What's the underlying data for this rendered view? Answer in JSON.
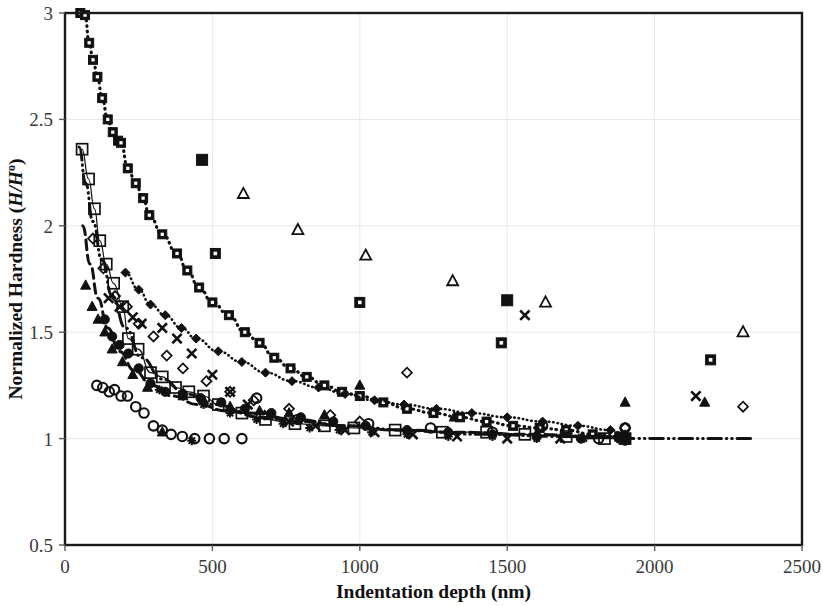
{
  "figure": {
    "background_color": "#ffffff",
    "ink_color": "#111111",
    "grid_color": "#e8e8e8"
  },
  "axes": {
    "x_title": "Indentation depth (nm)",
    "y_title_prefix": "Normalized Hardness (",
    "y_title_italic": "H/H",
    "y_title_sup": "o",
    "y_title_suffix": ")",
    "x_ticks": [
      "0",
      "500",
      "1000",
      "1500",
      "2000",
      "2500"
    ],
    "y_ticks": [
      "0.5",
      "1",
      "1.5",
      "2",
      "2.5",
      "3"
    ]
  },
  "chart_data": {
    "type": "scatter",
    "title": "",
    "xlabel": "Indentation depth (nm)",
    "ylabel": "Normalized Hardness (H/H°)",
    "xlim": [
      0,
      2500
    ],
    "ylim": [
      0.5,
      3
    ],
    "xticks": [
      0,
      500,
      1000,
      1500,
      2000,
      2500
    ],
    "yticks": [
      0.5,
      1,
      1.5,
      2,
      2.5,
      3
    ],
    "grid": "horizontal",
    "legend": "none",
    "series": [
      {
        "name": "dotted-square-dot",
        "marker": "square-dot",
        "line": "dotted",
        "line_width": 3.2,
        "marker_size": 9,
        "points": [
          [
            52,
            3.0
          ],
          [
            68,
            2.99
          ],
          [
            82,
            2.86
          ],
          [
            95,
            2.78
          ],
          [
            110,
            2.7
          ],
          [
            126,
            2.6
          ],
          [
            145,
            2.5
          ],
          [
            162,
            2.44
          ],
          [
            180,
            2.4
          ],
          [
            190,
            2.39
          ],
          [
            213,
            2.27
          ],
          [
            240,
            2.2
          ],
          [
            265,
            2.13
          ],
          [
            286,
            2.05
          ],
          [
            330,
            1.96
          ],
          [
            380,
            1.87
          ],
          [
            415,
            1.79
          ],
          [
            455,
            1.71
          ],
          [
            500,
            1.64
          ],
          [
            556,
            1.58
          ],
          [
            610,
            1.5
          ],
          [
            660,
            1.45
          ],
          [
            710,
            1.38
          ],
          [
            765,
            1.33
          ],
          [
            820,
            1.29
          ],
          [
            880,
            1.25
          ],
          [
            940,
            1.22
          ],
          [
            1000,
            1.2
          ],
          [
            1080,
            1.17
          ],
          [
            1160,
            1.14
          ],
          [
            1250,
            1.12
          ],
          [
            1340,
            1.1
          ],
          [
            1430,
            1.08
          ],
          [
            1520,
            1.06
          ],
          [
            1610,
            1.05
          ],
          [
            1700,
            1.04
          ],
          [
            1790,
            1.02
          ],
          [
            1880,
            1.01
          ],
          [
            1900,
            1.0
          ]
        ]
      },
      {
        "name": "open-square-thin-line",
        "marker": "square-open",
        "line": "solid-thin",
        "line_width": 1.2,
        "marker_size": 11,
        "points": [
          [
            58,
            2.36
          ],
          [
            80,
            2.22
          ],
          [
            100,
            2.08
          ],
          [
            118,
            1.93
          ],
          [
            140,
            1.82
          ],
          [
            165,
            1.73
          ],
          [
            196,
            1.62
          ],
          [
            215,
            1.47
          ],
          [
            248,
            1.42
          ],
          [
            290,
            1.31
          ],
          [
            330,
            1.29
          ],
          [
            375,
            1.24
          ],
          [
            420,
            1.22
          ],
          [
            470,
            1.2
          ],
          [
            520,
            1.16
          ],
          [
            600,
            1.12
          ],
          [
            680,
            1.09
          ],
          [
            780,
            1.07
          ],
          [
            880,
            1.06
          ],
          [
            980,
            1.05
          ],
          [
            1120,
            1.04
          ],
          [
            1280,
            1.03
          ],
          [
            1430,
            1.03
          ],
          [
            1560,
            1.02
          ],
          [
            1700,
            1.01
          ],
          [
            1830,
            1.0
          ],
          [
            1900,
            1.0
          ]
        ]
      },
      {
        "name": "open-diamond",
        "marker": "diamond-open",
        "line": "none",
        "marker_size": 10,
        "points": [
          [
            95,
            1.94
          ],
          [
            130,
            1.8
          ],
          [
            170,
            1.67
          ],
          [
            210,
            1.62
          ],
          [
            250,
            1.54
          ],
          [
            300,
            1.48
          ],
          [
            345,
            1.39
          ],
          [
            400,
            1.33
          ],
          [
            480,
            1.27
          ],
          [
            560,
            1.22
          ],
          [
            640,
            1.18
          ],
          [
            760,
            1.14
          ],
          [
            900,
            1.11
          ],
          [
            1000,
            1.08
          ],
          [
            1160,
            1.31
          ],
          [
            1900,
            1.05
          ],
          [
            2300,
            1.15
          ]
        ]
      },
      {
        "name": "filled-diamond-dotted",
        "marker": "diamond-filled",
        "line": "dotted",
        "line_width": 2.6,
        "marker_size": 9,
        "points": [
          [
            205,
            1.78
          ],
          [
            250,
            1.7
          ],
          [
            290,
            1.63
          ],
          [
            340,
            1.58
          ],
          [
            395,
            1.52
          ],
          [
            445,
            1.47
          ],
          [
            520,
            1.41
          ],
          [
            600,
            1.36
          ],
          [
            680,
            1.31
          ],
          [
            770,
            1.27
          ],
          [
            860,
            1.24
          ],
          [
            950,
            1.21
          ],
          [
            1050,
            1.18
          ],
          [
            1150,
            1.16
          ],
          [
            1260,
            1.14
          ],
          [
            1380,
            1.12
          ],
          [
            1500,
            1.1
          ],
          [
            1620,
            1.08
          ],
          [
            1740,
            1.06
          ],
          [
            1850,
            1.04
          ],
          [
            1900,
            1.02
          ]
        ]
      },
      {
        "name": "open-triangle",
        "marker": "triangle-open",
        "line": "none",
        "marker_size": 11,
        "points": [
          [
            605,
            2.15
          ],
          [
            790,
            1.98
          ],
          [
            1020,
            1.86
          ],
          [
            1315,
            1.74
          ],
          [
            1630,
            1.64
          ],
          [
            2300,
            1.5
          ]
        ]
      },
      {
        "name": "filled-square",
        "marker": "square-filled",
        "line": "none",
        "marker_size": 11,
        "points": [
          [
            465,
            2.31
          ],
          [
            1500,
            1.65
          ]
        ]
      },
      {
        "name": "square-dot-outlier",
        "marker": "square-dot",
        "line": "none",
        "marker_size": 10,
        "points": [
          [
            510,
            1.87
          ],
          [
            1000,
            1.64
          ],
          [
            1480,
            1.45
          ],
          [
            2190,
            1.37
          ]
        ]
      },
      {
        "name": "x-cross",
        "marker": "x",
        "line": "none",
        "marker_size": 11,
        "points": [
          [
            148,
            1.66
          ],
          [
            185,
            1.62
          ],
          [
            230,
            1.57
          ],
          [
            260,
            1.54
          ],
          [
            330,
            1.52
          ],
          [
            380,
            1.47
          ],
          [
            430,
            1.4
          ],
          [
            500,
            1.3
          ],
          [
            560,
            1.22
          ],
          [
            620,
            1.16
          ],
          [
            690,
            1.11
          ],
          [
            760,
            1.08
          ],
          [
            850,
            1.06
          ],
          [
            950,
            1.04
          ],
          [
            1050,
            1.03
          ],
          [
            1180,
            1.02
          ],
          [
            1330,
            1.01
          ],
          [
            1500,
            1.0
          ],
          [
            1680,
            1.0
          ],
          [
            1560,
            1.58
          ],
          [
            2140,
            1.2
          ]
        ]
      },
      {
        "name": "filled-triangle",
        "marker": "triangle-filled",
        "line": "none",
        "marker_size": 10,
        "points": [
          [
            70,
            1.72
          ],
          [
            92,
            1.62
          ],
          [
            112,
            1.56
          ],
          [
            135,
            1.5
          ],
          [
            160,
            1.42
          ],
          [
            195,
            1.36
          ],
          [
            230,
            1.3
          ],
          [
            280,
            1.24
          ],
          [
            330,
            1.03
          ],
          [
            400,
            1.2
          ],
          [
            470,
            1.18
          ],
          [
            560,
            1.15
          ],
          [
            660,
            1.13
          ],
          [
            760,
            1.12
          ],
          [
            880,
            1.11
          ],
          [
            1000,
            1.25
          ],
          [
            1320,
            1.1
          ],
          [
            1900,
            1.17
          ],
          [
            2170,
            1.17
          ]
        ]
      },
      {
        "name": "filled-circle",
        "marker": "circle-filled",
        "line": "none",
        "marker_size": 10,
        "points": [
          [
            135,
            1.56
          ],
          [
            160,
            1.48
          ],
          [
            185,
            1.44
          ],
          [
            215,
            1.4
          ],
          [
            250,
            1.33
          ],
          [
            290,
            1.26
          ],
          [
            340,
            1.22
          ],
          [
            400,
            1.21
          ],
          [
            460,
            1.19
          ],
          [
            530,
            1.17
          ],
          [
            610,
            1.14
          ],
          [
            700,
            1.12
          ],
          [
            800,
            1.1
          ],
          [
            910,
            1.08
          ],
          [
            1020,
            1.06
          ],
          [
            1160,
            1.04
          ],
          [
            1300,
            1.03
          ],
          [
            1450,
            1.02
          ],
          [
            1600,
            1.01
          ],
          [
            1750,
            1.0
          ],
          [
            1880,
            1.0
          ],
          [
            1900,
            0.99
          ]
        ]
      },
      {
        "name": "open-circle",
        "marker": "circle-open",
        "line": "none",
        "marker_size": 10,
        "points": [
          [
            108,
            1.25
          ],
          [
            128,
            1.24
          ],
          [
            150,
            1.22
          ],
          [
            168,
            1.23
          ],
          [
            190,
            1.2
          ],
          [
            212,
            1.2
          ],
          [
            240,
            1.15
          ],
          [
            268,
            1.12
          ],
          [
            300,
            1.06
          ],
          [
            330,
            1.04
          ],
          [
            360,
            1.02
          ],
          [
            398,
            1.01
          ],
          [
            440,
            1.0
          ],
          [
            490,
            1.0
          ],
          [
            540,
            1.0
          ],
          [
            600,
            1.0
          ],
          [
            650,
            1.19
          ],
          [
            790,
            1.09
          ],
          [
            1030,
            1.07
          ],
          [
            1240,
            1.05
          ],
          [
            1450,
            1.03
          ],
          [
            1620,
            1.06
          ],
          [
            1810,
            1.0
          ],
          [
            1900,
            1.05
          ]
        ]
      },
      {
        "name": "asterisk-plus",
        "marker": "asterisk",
        "line": "none",
        "marker_size": 10,
        "points": [
          [
            320,
            1.23
          ],
          [
            400,
            1.2
          ],
          [
            470,
            1.16
          ],
          [
            560,
            1.12
          ],
          [
            650,
            1.09
          ],
          [
            740,
            1.07
          ],
          [
            830,
            1.05
          ],
          [
            930,
            1.04
          ],
          [
            1040,
            1.03
          ],
          [
            1160,
            1.02
          ],
          [
            1300,
            1.01
          ],
          [
            1450,
            1.01
          ],
          [
            1600,
            1.0
          ],
          [
            1760,
            1.0
          ],
          [
            430,
            0.99
          ]
        ]
      },
      {
        "name": "dash-dot-fit",
        "marker": "none",
        "line": "dash-dot-dot",
        "line_width": 3.0,
        "points": [
          [
            48,
            2.37
          ],
          [
            70,
            2.2
          ],
          [
            95,
            2.02
          ],
          [
            125,
            1.84
          ],
          [
            160,
            1.67
          ],
          [
            205,
            1.52
          ],
          [
            260,
            1.38
          ],
          [
            330,
            1.28
          ],
          [
            410,
            1.21
          ],
          [
            510,
            1.16
          ],
          [
            630,
            1.12
          ],
          [
            780,
            1.09
          ],
          [
            950,
            1.06
          ],
          [
            1150,
            1.04
          ],
          [
            1400,
            1.02
          ],
          [
            1700,
            1.01
          ],
          [
            2000,
            1.0
          ],
          [
            2330,
            1.0
          ]
        ]
      },
      {
        "name": "dashed-fit",
        "marker": "none",
        "line": "dashed",
        "line_width": 3.0,
        "points": [
          [
            60,
            2.0
          ],
          [
            85,
            1.82
          ],
          [
            112,
            1.66
          ],
          [
            145,
            1.52
          ],
          [
            185,
            1.41
          ],
          [
            235,
            1.32
          ],
          [
            295,
            1.25
          ],
          [
            365,
            1.2
          ],
          [
            450,
            1.16
          ],
          [
            550,
            1.13
          ],
          [
            665,
            1.1
          ],
          [
            800,
            1.08
          ],
          [
            950,
            1.06
          ],
          [
            1120,
            1.04
          ],
          [
            1320,
            1.03
          ],
          [
            1560,
            1.02
          ],
          [
            1830,
            1.01
          ],
          [
            1920,
            1.0
          ]
        ]
      }
    ]
  }
}
